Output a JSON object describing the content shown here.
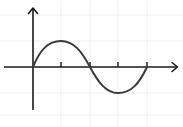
{
  "figure": {
    "colors": {
      "background": "#ffffff",
      "grid": "#eeeeee",
      "axis": "#1a1a1a",
      "curve": "#3a3a3a"
    }
  },
  "axes": {
    "origin_px": [
      33,
      67
    ],
    "x_axis": {
      "from_px": 4,
      "to_px": 178,
      "arrow": true
    },
    "y_axis": {
      "from_px": 110,
      "to_px": 8,
      "arrow": true
    },
    "x_ticks_px": [
      61,
      90,
      118,
      147
    ],
    "labels": []
  },
  "curve": {
    "function": "sin",
    "period_px": 114,
    "amplitude_px": 26,
    "start_px": [
      33,
      67
    ],
    "peak_px": [
      61,
      41
    ],
    "zero_crossing_px": [
      90,
      67
    ],
    "trough_px": [
      118,
      93
    ],
    "end_px": [
      147,
      67
    ]
  }
}
